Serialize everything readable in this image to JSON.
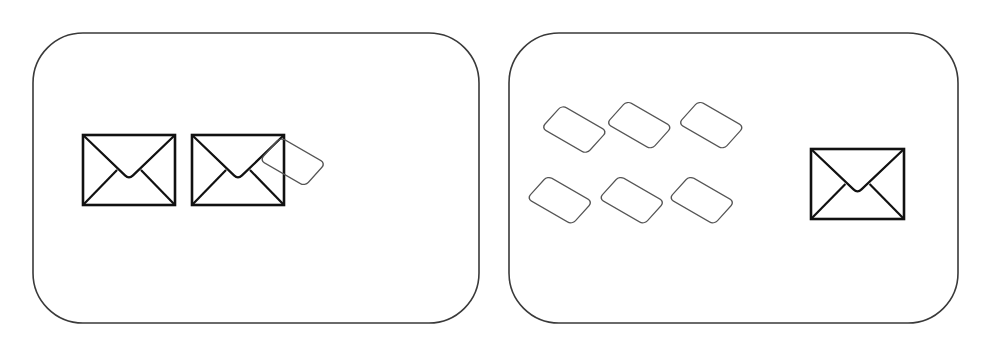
{
  "colors": {
    "background": "#ffffff",
    "panel_border": "#3a3a3a",
    "envelope_stroke": "#111111",
    "card_stroke": "#555555"
  },
  "panels": [
    {
      "name": "left-panel",
      "x": 33,
      "y": 33,
      "w": 446,
      "h": 290,
      "r": 50,
      "envelopes": [
        {
          "x": 83,
          "y": 135,
          "w": 92,
          "h": 70
        },
        {
          "x": 192,
          "y": 135,
          "w": 92,
          "h": 70
        }
      ],
      "cards": [
        {
          "cx": 326,
          "cy": 181
        }
      ]
    },
    {
      "name": "right-panel",
      "x": 509,
      "y": 33,
      "w": 449,
      "h": 290,
      "r": 50,
      "envelopes": [
        {
          "x": 811,
          "y": 149,
          "w": 93,
          "h": 70
        }
      ],
      "cards": [
        {
          "cx": 601,
          "cy": 145
        },
        {
          "cx": 665,
          "cy": 140
        },
        {
          "cx": 737,
          "cy": 140
        },
        {
          "cx": 601,
          "cy": 224
        },
        {
          "cx": 673,
          "cy": 224
        },
        {
          "cx": 743,
          "cy": 224
        }
      ]
    }
  ]
}
